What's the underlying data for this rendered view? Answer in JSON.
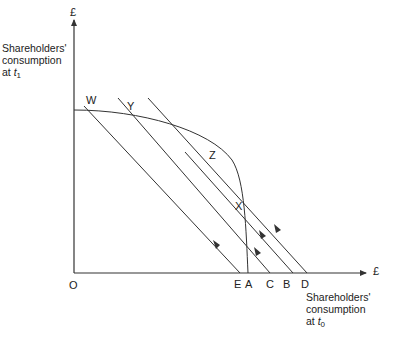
{
  "diagram": {
    "y_axis": {
      "unit": "£",
      "title_line1": "Shareholders'",
      "title_line2": "consumption",
      "title_line3_prefix": "at ",
      "title_var": "t",
      "title_sub": "1"
    },
    "x_axis": {
      "unit": "£",
      "title_line1": "Shareholders'",
      "title_line2": "consumption",
      "title_line3_prefix": "at ",
      "title_var": "t",
      "title_sub": "0"
    },
    "origin_label": "O",
    "curve_points": {
      "W": "W",
      "Y": "Y",
      "Z": "Z",
      "X": "X"
    },
    "axis_points": {
      "E": "E",
      "A": "A",
      "C": "C",
      "B": "B",
      "D": "D"
    },
    "colors": {
      "line": "#333333",
      "text": "#222222"
    }
  }
}
